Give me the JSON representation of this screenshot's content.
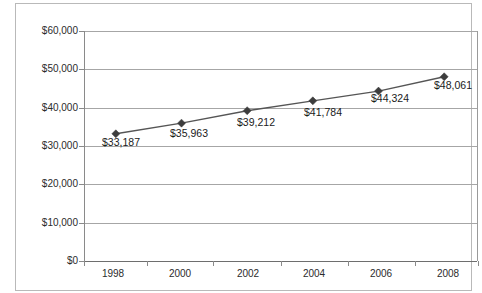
{
  "chart_data": {
    "type": "line",
    "title": "",
    "subtitle": "",
    "xlabel": "",
    "ylabel": "",
    "categories": [
      "1998",
      "2000",
      "2002",
      "2004",
      "2006",
      "2008"
    ],
    "values": [
      33187,
      35963,
      39212,
      41784,
      44324,
      48061
    ],
    "point_labels": [
      "$33,187",
      "$35,963",
      "$39,212",
      "$41,784",
      "$44,324",
      "$48,061"
    ],
    "ytick_labels": [
      "$60,000",
      "$50,000",
      "$40,000",
      "$30,000",
      "$20,000",
      "$10,000",
      "$0"
    ],
    "ytick_values": [
      60000,
      50000,
      40000,
      30000,
      20000,
      10000,
      0
    ],
    "ylim": [
      0,
      60000
    ],
    "grid": true,
    "legend": false,
    "legend_position": "none",
    "series": [
      {
        "name": "",
        "values": [
          33187,
          35963,
          39212,
          41784,
          44324,
          48061
        ],
        "marker": "diamond",
        "line_color": "#555555",
        "marker_color": "#3d3d3d"
      }
    ],
    "colors": {
      "line": "#555555",
      "marker": "#3d3d3d",
      "gridline": "#a6a6a6",
      "axis": "#8a8a8a",
      "frame": "#b9b9b9",
      "background": "#ffffff",
      "text": "#2b2b2b"
    }
  }
}
